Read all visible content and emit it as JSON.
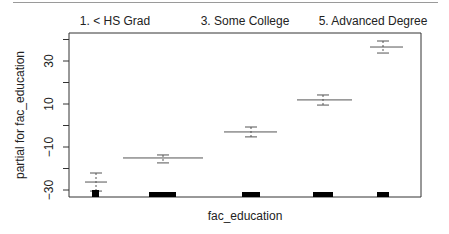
{
  "chart_data": {
    "type": "errorbar",
    "title": "",
    "xlabel": "fac_education",
    "ylabel": "partial for fac_education",
    "ylim": [
      -32,
      42
    ],
    "yticks": [
      -30,
      -20,
      -10,
      0,
      10,
      20,
      30,
      40
    ],
    "ytick_labels": [
      "-30",
      "-10",
      "10",
      "30"
    ],
    "grid": false,
    "category_labels_top": [
      "1. < HS Grad",
      "3. Some College",
      "5. Advanced Degree"
    ],
    "categories": [
      "1. < HS Grad",
      "2. HS Grad",
      "3. Some College",
      "4. College Grad",
      "5. Advanced Degree"
    ],
    "series": [
      {
        "name": "estimate",
        "values": [
          -26.3,
          -15.1,
          -3.0,
          11.9,
          36.5
        ]
      },
      {
        "name": "upper",
        "values": [
          -22.1,
          -13.7,
          -0.7,
          14.2,
          39.3
        ]
      },
      {
        "name": "lower",
        "values": [
          -30.5,
          -17.4,
          -5.3,
          9.5,
          33.7
        ]
      }
    ],
    "rug_relative_width": [
      0.07,
      0.27,
      0.18,
      0.2,
      0.12
    ]
  },
  "geometry": {
    "plot": {
      "x0": 69,
      "x1": 421,
      "y0": 33,
      "y1": 197
    },
    "y_zero_px": 125.5,
    "px_per_unit": 2.15,
    "groups": [
      {
        "cx": 96,
        "x0": 85,
        "x1": 107,
        "rug": [
          92,
          99
        ]
      },
      {
        "cx": 163,
        "x0": 123,
        "x1": 203,
        "rug": [
          149,
          176
        ]
      },
      {
        "cx": 251,
        "x0": 224,
        "x1": 277,
        "rug": [
          242,
          260
        ]
      },
      {
        "cx": 323,
        "x0": 297,
        "x1": 352,
        "rug": [
          313,
          333
        ]
      },
      {
        "cx": 383,
        "x0": 370,
        "x1": 403,
        "rug": [
          377,
          389
        ]
      }
    ]
  }
}
